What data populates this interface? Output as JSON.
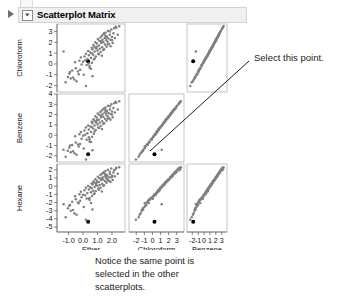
{
  "window": {
    "title": "Scatterplot Matrix",
    "disclosure_icon": "triangle-right-icon",
    "twisty_icon": "chevron-down-icon"
  },
  "annotations": {
    "callout": "Select this point.",
    "caption_lines": [
      "Notice the same point is",
      "selected in the other",
      "scatterplots."
    ]
  },
  "colors": {
    "point": "#808080",
    "selected_point": "#000000",
    "panel_border": "#b5b5b5",
    "axis": "#555555",
    "title_bar_bg": "#f0f0ef",
    "title_bar_border": "#d3d3d0"
  },
  "chart_data": {
    "type": "scatter",
    "title": "Scatterplot Matrix",
    "layout": "matrix",
    "rows": [
      "Chloroform",
      "Benzene",
      "Hexane"
    ],
    "columns": [
      "Ether",
      "Chloroform",
      "Benzene"
    ],
    "grid": false,
    "legend": "none",
    "axes": {
      "Ether": {
        "label": "Ether",
        "ticks": [
          -1.0,
          0.0,
          1.0,
          2.0
        ],
        "tick_labels": [
          "-1.0",
          "0.0",
          "1.0",
          "2.0"
        ],
        "lim": [
          -1.8,
          2.9
        ]
      },
      "Chloroform": {
        "label": "Chloroform",
        "ticks": [
          -2,
          -1,
          0,
          1,
          2,
          3
        ],
        "tick_labels": [
          "-2",
          "-1",
          "0",
          "1",
          "2",
          "3"
        ],
        "lim": [
          -2.9,
          3.9
        ]
      },
      "Benzene": {
        "label": "Benzene",
        "ticks": [
          -2,
          -1,
          0,
          1,
          2,
          3
        ],
        "tick_labels": [
          "-2",
          "-1",
          "0",
          "1",
          "2",
          "3"
        ],
        "lim": [
          -2.9,
          3.9
        ]
      },
      "Hexane": {
        "label": "Hexane",
        "ticks": [
          2,
          1,
          0,
          -1,
          -2,
          -3,
          -4,
          -5
        ],
        "tick_labels": [
          "2",
          "1",
          "0",
          "-1",
          "-2",
          "-3",
          "-4",
          "-5"
        ],
        "lim": [
          -5.6,
          2.7
        ]
      }
    },
    "y_axes": {
      "Chloroform": {
        "ticks": [
          3,
          2,
          1,
          0,
          -1,
          -2
        ],
        "tick_labels": [
          "3",
          "2",
          "1",
          "0",
          "-1",
          "-2"
        ],
        "lim": [
          -2.6,
          3.7
        ]
      },
      "Benzene": {
        "ticks": [
          4,
          3,
          2,
          1,
          0,
          -1,
          -2
        ],
        "tick_labels": [
          "4",
          "3",
          "2",
          "1",
          "0",
          "-1",
          "-2"
        ],
        "lim": [
          -2.6,
          4.0
        ]
      },
      "Hexane": {
        "ticks": [
          2,
          1,
          0,
          -1,
          -2,
          -3,
          -4,
          -5
        ],
        "tick_labels": [
          "2",
          "1",
          "0",
          "-1",
          "-2",
          "-3",
          "-4",
          "-5"
        ],
        "lim": [
          -5.6,
          2.7
        ]
      }
    },
    "selected_point": {
      "Ether": 0.35,
      "Chloroform": 0.25,
      "Benzene": -1.85,
      "Hexane": -4.35
    },
    "n_points": 100,
    "correlations": {
      "Chloroform_vs_Ether": 0.78,
      "Benzene_vs_Ether": 0.84,
      "Benzene_vs_Chloroform": 0.95,
      "Hexane_vs_Ether": 0.7,
      "Hexane_vs_Chloroform": 0.88,
      "Hexane_vs_Benzene": 0.92
    },
    "data": {
      "Ether": [
        0.35,
        -1.35,
        -1.05,
        -0.85,
        -0.95,
        -0.75,
        -0.6,
        -0.5,
        -0.45,
        -0.3,
        -0.2,
        -0.15,
        -0.1,
        0.0,
        0.05,
        0.1,
        0.15,
        0.2,
        0.25,
        0.3,
        0.35,
        0.4,
        0.45,
        0.5,
        0.55,
        0.6,
        0.62,
        0.65,
        0.7,
        0.72,
        0.75,
        0.78,
        0.8,
        0.85,
        0.88,
        0.9,
        0.95,
        1.0,
        1.02,
        1.05,
        1.1,
        1.12,
        1.15,
        1.2,
        1.22,
        1.25,
        1.3,
        1.32,
        1.35,
        1.4,
        1.42,
        1.45,
        1.5,
        1.52,
        1.55,
        1.6,
        1.62,
        1.65,
        1.7,
        1.72,
        1.75,
        1.8,
        1.85,
        1.9,
        1.95,
        2.0,
        2.05,
        2.1,
        2.2,
        2.3,
        2.4,
        2.5,
        -1.2,
        -0.9,
        -0.7,
        -0.55,
        -0.35,
        -0.25,
        0.45,
        0.6,
        0.8,
        0.95,
        1.1,
        1.25,
        1.4,
        1.55,
        1.7,
        1.85,
        2.0,
        2.15,
        0.2,
        0.4,
        0.55,
        0.9,
        1.3,
        1.6,
        1.9,
        2.25,
        0.65,
        1.45
      ],
      "Chloroform": [
        0.25,
        1.15,
        -1.2,
        -1.35,
        -0.9,
        -0.6,
        -1.45,
        -0.4,
        -1.6,
        -0.95,
        -0.55,
        0.6,
        -0.05,
        0.2,
        -1.0,
        0.7,
        0.35,
        0.95,
        -0.1,
        0.45,
        1.2,
        0.8,
        -0.35,
        1.05,
        0.55,
        1.5,
        0.1,
        1.35,
        0.85,
        1.75,
        0.4,
        1.6,
        1.15,
        2.0,
        0.7,
        1.45,
        1.9,
        1.25,
        2.3,
        0.95,
        1.7,
        2.15,
        1.4,
        2.45,
        1.1,
        1.95,
        2.6,
        1.55,
        2.25,
        2.0,
        2.75,
        1.35,
        2.4,
        1.8,
        2.9,
        2.2,
        1.6,
        2.55,
        2.05,
        3.05,
        2.35,
        1.85,
        2.7,
        2.25,
        3.2,
        2.5,
        1.95,
        2.85,
        2.4,
        3.35,
        2.7,
        3.5,
        -1.7,
        -0.75,
        -1.25,
        0.15,
        -0.7,
        0.3,
        -0.2,
        1.0,
        0.5,
        1.6,
        0.9,
        2.1,
        1.3,
        2.6,
        1.8,
        3.0,
        2.2,
        3.3,
        -2.05,
        0.05,
        -0.45,
        1.45,
        0.75,
        2.45,
        1.65,
        3.45,
        -1.15,
        2.85
      ],
      "Benzene": [
        -1.85,
        -1.4,
        -1.5,
        -1.65,
        -1.2,
        -0.95,
        -1.75,
        -0.7,
        -1.9,
        -1.1,
        -0.85,
        0.3,
        -0.35,
        -0.05,
        -1.3,
        0.45,
        0.05,
        0.75,
        -0.45,
        0.2,
        0.95,
        0.55,
        -0.6,
        0.85,
        0.3,
        1.3,
        -0.15,
        1.15,
        0.65,
        1.55,
        0.15,
        1.4,
        0.95,
        1.85,
        0.5,
        1.25,
        1.7,
        1.05,
        2.1,
        0.75,
        1.5,
        1.95,
        1.2,
        2.25,
        0.9,
        1.75,
        2.4,
        1.35,
        2.05,
        1.8,
        2.55,
        1.15,
        2.2,
        1.6,
        2.7,
        2.0,
        1.4,
        2.35,
        1.85,
        2.85,
        2.15,
        1.65,
        2.5,
        2.05,
        3.0,
        2.3,
        1.75,
        2.65,
        2.2,
        3.15,
        2.5,
        3.3,
        -2.1,
        -1.0,
        -1.55,
        -0.1,
        -0.9,
        0.1,
        -0.4,
        0.8,
        0.35,
        1.45,
        0.7,
        1.9,
        1.1,
        2.45,
        1.6,
        2.8,
        2.0,
        3.1,
        -2.35,
        -0.2,
        -0.65,
        1.25,
        0.6,
        2.3,
        1.5,
        3.25,
        -1.45,
        2.6
      ],
      "Hexane": [
        -4.35,
        -2.2,
        -2.7,
        -3.0,
        -2.4,
        -1.9,
        -3.3,
        -1.6,
        -3.5,
        -2.1,
        -1.8,
        -0.7,
        -1.35,
        -1.05,
        -2.55,
        -0.5,
        -1.1,
        -0.2,
        -1.5,
        -0.85,
        0.0,
        -0.4,
        -1.7,
        -0.15,
        -0.75,
        0.35,
        -1.2,
        0.2,
        -0.55,
        0.55,
        -0.95,
        0.4,
        -0.1,
        0.85,
        -0.6,
        0.25,
        0.65,
        0.05,
        1.15,
        -0.3,
        0.5,
        0.95,
        0.15,
        1.35,
        -0.2,
        0.75,
        1.5,
        0.3,
        1.05,
        0.8,
        1.7,
        0.1,
        1.2,
        0.6,
        1.85,
        1.0,
        0.4,
        1.35,
        0.85,
        2.0,
        1.15,
        0.65,
        1.5,
        1.05,
        2.15,
        1.3,
        0.75,
        1.65,
        1.2,
        2.25,
        1.5,
        2.3,
        -3.8,
        -2.3,
        -2.9,
        -1.25,
        -2.0,
        -1.0,
        -1.45,
        -0.25,
        -0.9,
        0.45,
        -0.45,
        0.9,
        0.05,
        1.45,
        0.7,
        1.75,
        1.1,
        1.95,
        -4.1,
        -1.55,
        -2.05,
        0.15,
        -0.65,
        1.25,
        0.5,
        2.1,
        -2.85,
        1.6
      ]
    }
  }
}
